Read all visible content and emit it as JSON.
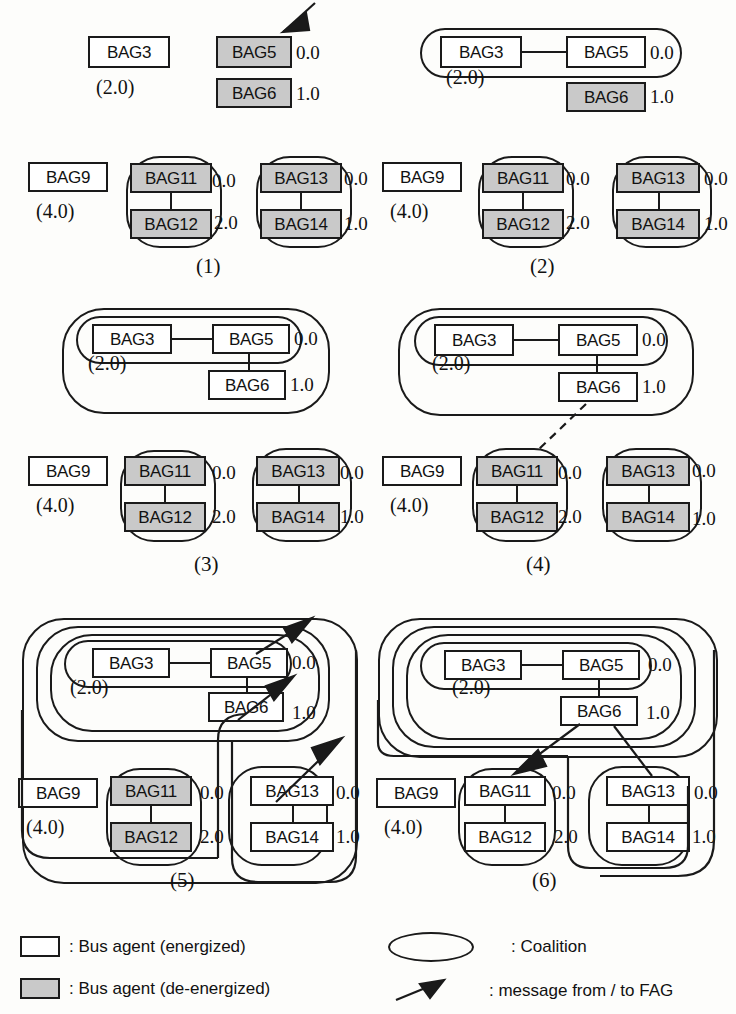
{
  "diagram": {
    "colors": {
      "energized_fill": "#ffffff",
      "deenergized_fill": "#c9c9c9",
      "stroke": "#1a1a1a",
      "background": "#fdfdfb"
    },
    "agent_labels": {
      "bag3": "BAG3",
      "bag5": "BAG5",
      "bag6": "BAG6",
      "bag9": "BAG9",
      "bag11": "BAG11",
      "bag12": "BAG12",
      "bag13": "BAG13",
      "bag14": "BAG14"
    },
    "values": {
      "v00": "0.0",
      "v10": "1.0",
      "v20": "2.0",
      "p20": "(2.0)",
      "p40": "(4.0)"
    },
    "panels": [
      {
        "id": "panel-1",
        "label": "(1)",
        "caption": "Initial state: BAG5, BAG6, BAG11, BAG12, BAG13, BAG14 de-energized; FAG message arrives at BAG5",
        "agents": [
          {
            "name": "BAG3",
            "state": "energized",
            "value": null
          },
          {
            "name": "BAG5",
            "state": "de-energized",
            "value": "0.0"
          },
          {
            "name": "BAG6",
            "state": "de-energized",
            "value": "1.0"
          },
          {
            "name": "BAG9",
            "state": "energized",
            "value": null
          },
          {
            "name": "BAG11",
            "state": "de-energized",
            "value": "0.0"
          },
          {
            "name": "BAG12",
            "state": "de-energized",
            "value": "2.0"
          },
          {
            "name": "BAG13",
            "state": "de-energized",
            "value": "0.0"
          },
          {
            "name": "BAG14",
            "state": "de-energized",
            "value": "1.0"
          }
        ],
        "loads": [
          "(2.0)",
          "(4.0)"
        ],
        "coalitions": 2,
        "messages": 1
      },
      {
        "id": "panel-2",
        "label": "(2)",
        "caption": "BAG3 and BAG5 form a coalition; BAG5 restored",
        "agents": [
          {
            "name": "BAG3",
            "state": "energized",
            "value": null
          },
          {
            "name": "BAG5",
            "state": "energized",
            "value": "0.0"
          },
          {
            "name": "BAG6",
            "state": "de-energized",
            "value": "1.0"
          },
          {
            "name": "BAG9",
            "state": "energized",
            "value": null
          },
          {
            "name": "BAG11",
            "state": "de-energized",
            "value": "0.0"
          },
          {
            "name": "BAG12",
            "state": "de-energized",
            "value": "2.0"
          },
          {
            "name": "BAG13",
            "state": "de-energized",
            "value": "0.0"
          },
          {
            "name": "BAG14",
            "state": "de-energized",
            "value": "1.0"
          }
        ],
        "loads": [
          "(2.0)",
          "(4.0)"
        ],
        "coalitions": 3,
        "messages": 0
      },
      {
        "id": "panel-3",
        "label": "(3)",
        "caption": "Coalition expands to include BAG6",
        "agents": [
          {
            "name": "BAG3",
            "state": "energized",
            "value": null
          },
          {
            "name": "BAG5",
            "state": "energized",
            "value": "0.0"
          },
          {
            "name": "BAG6",
            "state": "energized",
            "value": "1.0"
          },
          {
            "name": "BAG9",
            "state": "energized",
            "value": null
          },
          {
            "name": "BAG11",
            "state": "de-energized",
            "value": "0.0"
          },
          {
            "name": "BAG12",
            "state": "de-energized",
            "value": "2.0"
          },
          {
            "name": "BAG13",
            "state": "de-energized",
            "value": "0.0"
          },
          {
            "name": "BAG14",
            "state": "de-energized",
            "value": "1.0"
          }
        ],
        "loads": [
          "(2.0)",
          "(4.0)"
        ],
        "coalitions": 4,
        "messages": 0
      },
      {
        "id": "panel-4",
        "label": "(4)",
        "caption": "Tentative (dashed) link proposed from BAG6 to BAG11",
        "agents": [
          {
            "name": "BAG3",
            "state": "energized",
            "value": null
          },
          {
            "name": "BAG5",
            "state": "energized",
            "value": "0.0"
          },
          {
            "name": "BAG6",
            "state": "energized",
            "value": "1.0"
          },
          {
            "name": "BAG9",
            "state": "energized",
            "value": null
          },
          {
            "name": "BAG11",
            "state": "de-energized",
            "value": "0.0"
          },
          {
            "name": "BAG12",
            "state": "de-energized",
            "value": "2.0"
          },
          {
            "name": "BAG13",
            "state": "de-energized",
            "value": "0.0"
          },
          {
            "name": "BAG14",
            "state": "de-energized",
            "value": "1.0"
          }
        ],
        "loads": [
          "(2.0)",
          "(4.0)"
        ],
        "coalitions": 4,
        "messages": 0
      },
      {
        "id": "panel-5",
        "label": "(5)",
        "caption": "BAG13 and BAG14 restored and joined; three messages sent to FAG",
        "agents": [
          {
            "name": "BAG3",
            "state": "energized",
            "value": null
          },
          {
            "name": "BAG5",
            "state": "energized",
            "value": "0.0"
          },
          {
            "name": "BAG6",
            "state": "energized",
            "value": "1.0"
          },
          {
            "name": "BAG9",
            "state": "energized",
            "value": null
          },
          {
            "name": "BAG11",
            "state": "de-energized",
            "value": "0.0"
          },
          {
            "name": "BAG12",
            "state": "de-energized",
            "value": "2.0"
          },
          {
            "name": "BAG13",
            "state": "energized",
            "value": "0.0"
          },
          {
            "name": "BAG14",
            "state": "energized",
            "value": "1.0"
          }
        ],
        "loads": [
          "(2.0)",
          "(4.0)"
        ],
        "coalitions": 5,
        "messages": 3
      },
      {
        "id": "panel-6",
        "label": "(6)",
        "caption": "All bus agents energized; message delivered to BAG11",
        "agents": [
          {
            "name": "BAG3",
            "state": "energized",
            "value": null
          },
          {
            "name": "BAG5",
            "state": "energized",
            "value": "0.0"
          },
          {
            "name": "BAG6",
            "state": "energized",
            "value": "1.0"
          },
          {
            "name": "BAG9",
            "state": "energized",
            "value": null
          },
          {
            "name": "BAG11",
            "state": "energized",
            "value": "0.0"
          },
          {
            "name": "BAG12",
            "state": "energized",
            "value": "2.0"
          },
          {
            "name": "BAG13",
            "state": "energized",
            "value": "0.0"
          },
          {
            "name": "BAG14",
            "state": "energized",
            "value": "1.0"
          }
        ],
        "loads": [
          "(2.0)",
          "(4.0)"
        ],
        "coalitions": 5,
        "messages": 1
      }
    ]
  },
  "legend": {
    "energized": ": Bus agent (energized)",
    "deenergized": ": Bus agent (de-energized)",
    "coalition": ": Coalition",
    "message": ": message from / to  FAG"
  }
}
